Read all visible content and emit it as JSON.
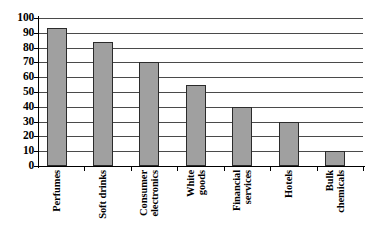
{
  "chart_data": {
    "type": "bar",
    "title": "",
    "subtitle": "",
    "xlabel": "",
    "ylabel": "",
    "categories": [
      "Perfumes",
      "Soft drinks",
      "Consumer electronics",
      "White goods",
      "Financial services",
      "Hotels",
      "Bulk chemicals"
    ],
    "category_lines": [
      [
        "Perfumes"
      ],
      [
        "Soft drinks"
      ],
      [
        "Consumer",
        "electronics"
      ],
      [
        "White",
        "goods"
      ],
      [
        "Financial",
        "services"
      ],
      [
        "Hotels"
      ],
      [
        "Bulk",
        "chemicals"
      ]
    ],
    "values": [
      93,
      84,
      70,
      55,
      40,
      30,
      10
    ],
    "ylim": [
      0,
      100
    ],
    "ytick_step": 10,
    "yticks": [
      0,
      10,
      20,
      30,
      40,
      50,
      60,
      70,
      80,
      90,
      100
    ],
    "ytick_labels": [
      "0",
      "10",
      "20",
      "30",
      "40",
      "50",
      "60",
      "70",
      "80",
      "90",
      "100"
    ],
    "grid": true,
    "grid_orientation": "horizontal",
    "legend": false,
    "legend_position": "none",
    "bar_fill_color": "#a0a0a0",
    "bar_border_color": "#2b2b2b",
    "gridline_color": "#4a4a4a",
    "axis_color": "#000000",
    "background_color": "#ffffff"
  }
}
